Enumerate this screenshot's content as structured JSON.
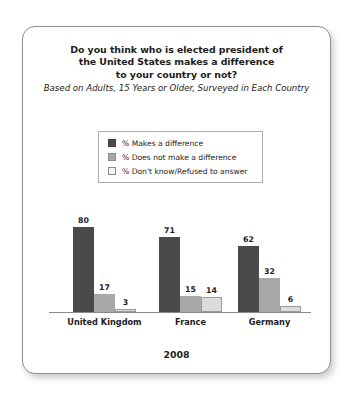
{
  "chart_data": {
    "type": "bar",
    "title": "Do you think who is elected president of the United States makes a difference to your country or not?",
    "title_lines": [
      "Do you think who is elected president of",
      "the United States makes a difference",
      "to your country or not?"
    ],
    "subtitle": "Based on Adults, 15 Years or Older, Surveyed in Each Country",
    "footer": "2008",
    "xlabel": "",
    "ylabel": "",
    "ylim": [
      0,
      100
    ],
    "grid": false,
    "legend_position": "top-center",
    "categories": [
      "United Kingdom",
      "France",
      "Germany"
    ],
    "series": [
      {
        "name": "% Makes a difference",
        "color": "#4a4a4a",
        "values": [
          80,
          71,
          62
        ]
      },
      {
        "name": "% Does not make a difference",
        "color": "#a8a8a8",
        "values": [
          17,
          15,
          32
        ]
      },
      {
        "name": "% Don't know/Refused to answer",
        "color": "#dcdcdc",
        "values": [
          3,
          14,
          6
        ]
      }
    ]
  },
  "legend": {
    "items": [
      {
        "label": "% Makes a difference",
        "color": "#4a4a4a",
        "border": "#3d3d3d"
      },
      {
        "label": "% Does not make a difference",
        "color": "#a8a8a8",
        "border": "#8c8c8c"
      },
      {
        "label": "% Don't know/Refused to answer",
        "color": "#f4f4f4",
        "border": "#8c8c8c"
      }
    ]
  },
  "colors": {
    "series_dark": "#4a4a4a",
    "series_medium": "#a8a8a8",
    "series_light": "#dcdcdc",
    "axis": "#8a8a8a",
    "card_border": "#8f8f8f",
    "text": "#1d1d1d",
    "background": "#ffffff"
  }
}
